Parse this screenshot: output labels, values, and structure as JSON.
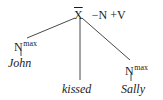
{
  "tree": {
    "root": {
      "category": "X",
      "bar": true,
      "features": "−N +V"
    },
    "children": [
      {
        "category": "N",
        "superscript": "max",
        "word": "John"
      },
      {
        "word": "kissed"
      },
      {
        "category": "N",
        "superscript": "max",
        "word": "Sally"
      }
    ]
  },
  "colors": {
    "ink": "#1a1a1a",
    "background": "#ffffff"
  }
}
